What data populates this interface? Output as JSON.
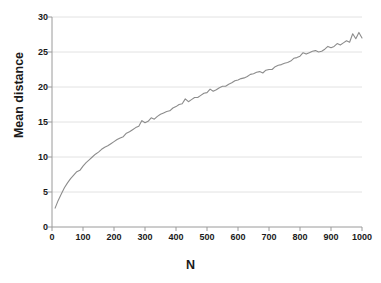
{
  "chart_data": {
    "type": "line",
    "title": "",
    "xlabel": "N",
    "ylabel": "Mean distance",
    "xlim": [
      0,
      1000
    ],
    "ylim": [
      0,
      30
    ],
    "grid": true,
    "legend": false,
    "line_color": "#8c8c8c",
    "xticks": [
      "0",
      "100",
      "200",
      "300",
      "400",
      "500",
      "600",
      "700",
      "800",
      "900",
      "1000"
    ],
    "yticks": [
      "0",
      "5",
      "10",
      "15",
      "20",
      "25",
      "30"
    ],
    "series": [
      {
        "name": "Mean distance",
        "x": [
          10,
          20,
          30,
          40,
          50,
          60,
          70,
          80,
          90,
          100,
          110,
          120,
          130,
          140,
          150,
          160,
          170,
          180,
          190,
          200,
          210,
          220,
          230,
          240,
          250,
          260,
          270,
          280,
          290,
          300,
          310,
          320,
          330,
          340,
          350,
          360,
          370,
          380,
          390,
          400,
          410,
          420,
          430,
          440,
          450,
          460,
          470,
          480,
          490,
          500,
          510,
          520,
          530,
          540,
          550,
          560,
          570,
          580,
          590,
          600,
          610,
          620,
          630,
          640,
          650,
          660,
          670,
          680,
          690,
          700,
          710,
          720,
          730,
          740,
          750,
          760,
          770,
          780,
          790,
          800,
          810,
          820,
          830,
          840,
          850,
          860,
          870,
          880,
          890,
          900,
          910,
          920,
          930,
          940,
          950,
          960,
          970,
          980,
          990,
          1000
        ],
        "y": [
          2.7,
          3.8,
          4.7,
          5.6,
          6.3,
          6.9,
          7.4,
          7.9,
          8.1,
          8.7,
          9.2,
          9.6,
          10.0,
          10.4,
          10.7,
          11.1,
          11.4,
          11.6,
          11.9,
          12.2,
          12.5,
          12.7,
          12.9,
          13.4,
          13.6,
          13.9,
          14.2,
          14.4,
          15.2,
          14.9,
          15.1,
          15.6,
          15.4,
          15.8,
          16.1,
          16.3,
          16.5,
          16.6,
          17.0,
          17.2,
          17.5,
          17.6,
          18.3,
          17.9,
          18.2,
          18.5,
          18.5,
          18.8,
          19.1,
          19.2,
          19.7,
          19.4,
          19.6,
          19.9,
          20.1,
          20.1,
          20.4,
          20.6,
          20.9,
          21.0,
          21.2,
          21.3,
          21.5,
          21.8,
          21.9,
          22.1,
          22.2,
          22.0,
          22.4,
          22.5,
          22.5,
          22.9,
          23.1,
          23.2,
          23.4,
          23.5,
          23.7,
          24.1,
          24.2,
          24.4,
          24.9,
          24.7,
          24.9,
          25.1,
          25.2,
          25.0,
          25.1,
          25.4,
          25.8,
          25.6,
          25.8,
          26.2,
          26.0,
          26.3,
          26.6,
          26.4,
          27.6,
          26.9,
          27.8,
          27.0
        ]
      }
    ]
  }
}
